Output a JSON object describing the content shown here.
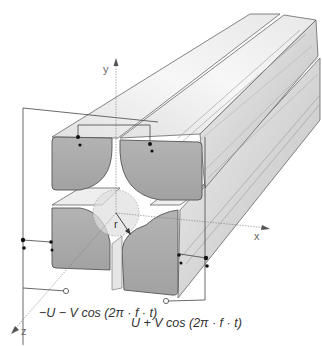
{
  "diagram": {
    "axes": {
      "x_label": "x",
      "y_label": "y",
      "z_label": "z",
      "radius_label": "r"
    },
    "voltages": {
      "left_pair": "−U − V cos (2π · f · t)",
      "right_pair": "U + V cos (2π · f · t)"
    },
    "colors": {
      "rod_front_face": "#a9a9a9",
      "rod_top_face": "#ececec",
      "rod_side_face": "#d4d4d4",
      "outline": "#555555",
      "background": "#ffffff",
      "wire": "#444444"
    }
  }
}
